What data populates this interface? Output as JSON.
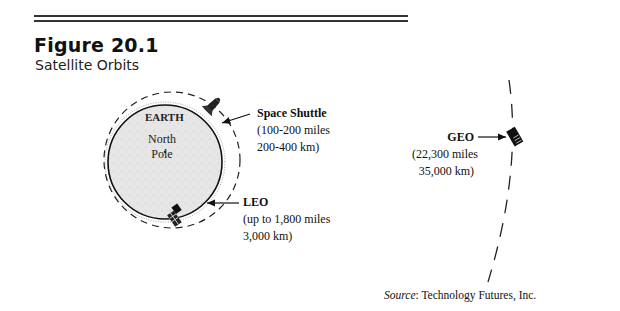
{
  "figure": {
    "number": "Figure 20.1",
    "title": "Satellite Orbits"
  },
  "earth": {
    "label": "EARTH",
    "pole_line1": "North",
    "pole_line2": "Pole"
  },
  "orbits": [
    {
      "id": "space-shuttle",
      "name": "Space Shuttle",
      "line1": "(100-200 miles",
      "line2": "200-400 km)"
    },
    {
      "id": "leo",
      "name": "LEO",
      "line1": "(up to 1,800 miles",
      "line2": "3,000 km)"
    },
    {
      "id": "geo",
      "name": "GEO",
      "line1": "(22,300 miles",
      "line2": "35,000 km)"
    }
  ],
  "source": {
    "label": "Source",
    "text": ": Technology Futures, Inc."
  },
  "colors": {
    "ink": "#111111",
    "earth_fill": "#e4e4e4",
    "rule": "#333333"
  }
}
